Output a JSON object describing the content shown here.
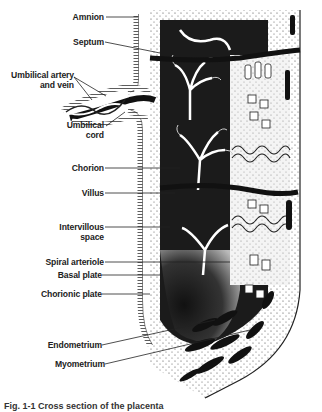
{
  "figure": {
    "labels": [
      {
        "id": "amnion",
        "text": "Amnion"
      },
      {
        "id": "septum",
        "text": "Septum"
      },
      {
        "id": "umbilical_vessels",
        "text": "Umbilical artery and vein",
        "line1": "Umbilical artery",
        "line2": "and vein"
      },
      {
        "id": "umbilical_cord",
        "text": "Umbilical cord",
        "line1": "Umbilical",
        "line2": "cord"
      },
      {
        "id": "chorion",
        "text": "Chorion"
      },
      {
        "id": "villus",
        "text": "Villus"
      },
      {
        "id": "intervillous_space",
        "text": "Intervillous space",
        "line1": "Intervillous",
        "line2": "space"
      },
      {
        "id": "spiral_arteriole",
        "text": "Spiral arteriole"
      },
      {
        "id": "basal_plate",
        "text": "Basal plate"
      },
      {
        "id": "chorionic_plate",
        "text": "Chorionic plate"
      },
      {
        "id": "endometrium",
        "text": "Endometrium"
      },
      {
        "id": "myometrium",
        "text": "Myometrium"
      }
    ],
    "caption": "Fig. 1-1 Cross section of the placenta",
    "colors": {
      "ink": "#1a1a1a",
      "paper": "#ffffff",
      "stipple": "#555555"
    }
  }
}
